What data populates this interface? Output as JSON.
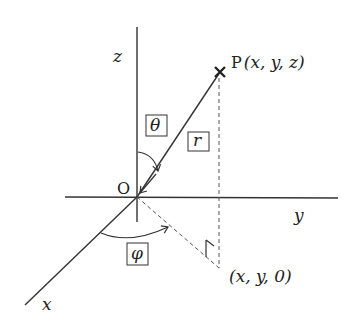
{
  "diagram": {
    "axes": {
      "x_label": "x",
      "y_label": "y",
      "z_label": "z"
    },
    "origin_label": "O",
    "point_label": "P(x, y, z)",
    "point_prefix": "P",
    "point_coords": "(x, y, z)",
    "projection_label": "(x, y, 0)",
    "angle_theta": "θ",
    "angle_phi": "φ",
    "radius_label": "r"
  }
}
